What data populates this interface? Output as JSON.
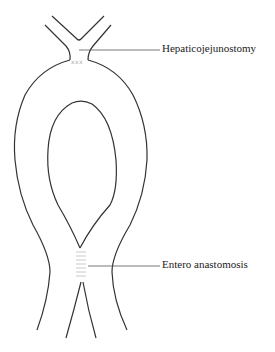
{
  "diagram": {
    "type": "anatomical-schematic",
    "labels": {
      "hepaticojejunostomy": "Hepaticojejunostomy",
      "entero_anastomosis": "Entero anastomosis"
    },
    "suture_marks": {
      "top": "xxx"
    },
    "colors": {
      "outline": "#333333",
      "leader": "#555555",
      "suture": "#aaaaaa"
    }
  }
}
